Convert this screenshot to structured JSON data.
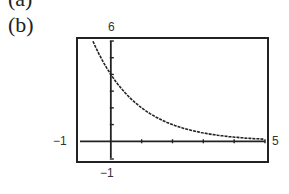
{
  "figure": {
    "part_label": "(b)",
    "previous_part_label": "(a)"
  },
  "window": {
    "ymax_label": "6",
    "ymin_label": "−1",
    "xmin_label": "−1",
    "xmax_label": "5"
  },
  "chart_data": {
    "type": "line",
    "title": "",
    "xlabel": "",
    "ylabel": "",
    "xlim": [
      -1,
      5
    ],
    "ylim": [
      -1,
      6
    ],
    "xscale_ticks": [
      1,
      2,
      3,
      4,
      5
    ],
    "yscale_ticks": [
      1,
      2,
      3,
      4,
      5,
      6
    ],
    "grid": false,
    "legend": null,
    "series": [
      {
        "name": "y = 4(1/2)^x",
        "x": [
          -0.58,
          0,
          0.5,
          1,
          1.5,
          2,
          2.5,
          3,
          3.5,
          4,
          4.5,
          5
        ],
        "values": [
          6.0,
          4.0,
          2.83,
          2.0,
          1.41,
          1.0,
          0.71,
          0.5,
          0.35,
          0.25,
          0.18,
          0.13
        ]
      }
    ],
    "annotations": [
      "graphing calculator window, exponential decay curve with y-intercept near 4"
    ]
  }
}
